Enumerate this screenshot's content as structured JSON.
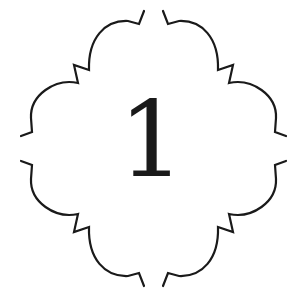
{
  "badge": {
    "numeral": "1",
    "stroke_color": "#1a1a1a",
    "background": "#ffffff"
  }
}
